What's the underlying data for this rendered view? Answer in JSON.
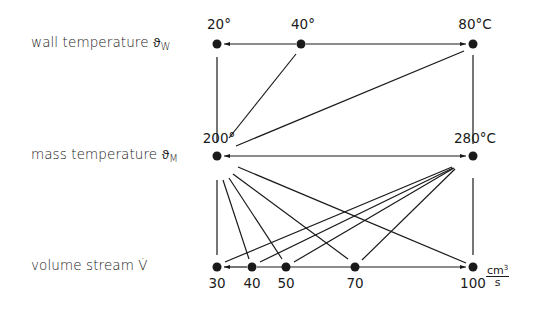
{
  "rows": {
    "wall": {
      "label": "wall temperature ϑ",
      "sub": "W"
    },
    "mass": {
      "label": "mass temperature ϑ",
      "sub": "M"
    },
    "volume": {
      "label": "volume stream  V̇",
      "sub": ""
    }
  },
  "wall_values": [
    "20°",
    "40°",
    "80°C"
  ],
  "mass_values": [
    "200°",
    "280°C"
  ],
  "volume_values": [
    "30",
    "40",
    "50",
    "70",
    "100"
  ],
  "volume_unit": {
    "numerator": "cm",
    "exp": "3",
    "denominator": "s"
  },
  "nodes": {
    "w20": [
      217,
      44
    ],
    "w40": [
      301,
      44
    ],
    "w80": [
      473,
      44
    ],
    "m200": [
      217,
      156
    ],
    "m280": [
      473,
      156
    ],
    "v30": [
      217,
      267
    ],
    "v40": [
      252,
      267
    ],
    "v50": [
      286,
      267
    ],
    "v70": [
      355,
      267
    ],
    "v100": [
      473,
      267
    ]
  },
  "edges": [
    [
      "w40",
      "w20",
      "arrow"
    ],
    [
      "w40",
      "w80",
      "arrow"
    ],
    [
      "w20",
      "m200",
      "line"
    ],
    [
      "w40",
      "m200",
      "line"
    ],
    [
      "w80",
      "m200",
      "line"
    ],
    [
      "w80",
      "m280",
      "line"
    ],
    [
      "m200",
      "m280",
      "double-arrow"
    ],
    [
      "m200",
      "v30",
      "line"
    ],
    [
      "m200",
      "v40",
      "line"
    ],
    [
      "m200",
      "v50",
      "line"
    ],
    [
      "m200",
      "v70",
      "line"
    ],
    [
      "m200",
      "v100",
      "line"
    ],
    [
      "m280",
      "v30",
      "line"
    ],
    [
      "m280",
      "v40",
      "line"
    ],
    [
      "m280",
      "v50",
      "line"
    ],
    [
      "m280",
      "v70",
      "line"
    ],
    [
      "m280",
      "v100",
      "line"
    ],
    [
      "v40",
      "v30",
      "arrow"
    ],
    [
      "v40",
      "v100",
      "arrow"
    ]
  ]
}
